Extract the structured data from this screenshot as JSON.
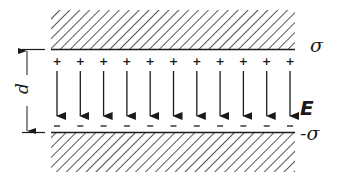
{
  "diagram": {
    "labels": {
      "top_plate_charge": "σ",
      "bottom_plate_charge": "-σ",
      "field": "E",
      "separation": "d"
    },
    "arrow_count": 11,
    "plus_sign": "+",
    "minus_sign": "–",
    "colors": {
      "ink": "#1a1a1a",
      "background": "#ffffff"
    }
  }
}
